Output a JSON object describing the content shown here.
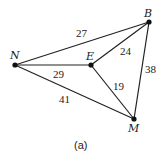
{
  "diagram": {
    "type": "weighted-graph",
    "caption": "(a)",
    "nodes": [
      {
        "id": "N",
        "label": "N",
        "x": 15,
        "y": 65
      },
      {
        "id": "E",
        "label": "E",
        "x": 91,
        "y": 65
      },
      {
        "id": "B",
        "label": "B",
        "x": 149,
        "y": 22
      },
      {
        "id": "M",
        "label": "M",
        "x": 134,
        "y": 119
      }
    ],
    "edges": [
      {
        "from": "N",
        "to": "B",
        "weight": "27"
      },
      {
        "from": "N",
        "to": "E",
        "weight": "29"
      },
      {
        "from": "N",
        "to": "M",
        "weight": "41"
      },
      {
        "from": "E",
        "to": "B",
        "weight": "24"
      },
      {
        "from": "E",
        "to": "M",
        "weight": "19"
      },
      {
        "from": "B",
        "to": "M",
        "weight": "38"
      }
    ]
  }
}
